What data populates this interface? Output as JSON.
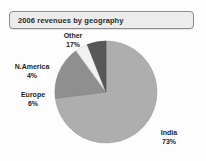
{
  "chart_data": {
    "type": "pie",
    "title": "2006 revenues by geography",
    "xlabel": "",
    "ylabel": "",
    "legend_position": "none",
    "grid": false,
    "categories": [
      "India",
      "Other",
      "N.America",
      "Europe"
    ],
    "values": [
      73,
      17,
      4,
      6
    ],
    "value_unit": "%",
    "start_angle_deg": 0,
    "direction": "clockwise",
    "slices": [
      {
        "name": "India",
        "label": "India",
        "value": 73,
        "value_label": "73%",
        "color": "#aeaeae",
        "start_deg": 0,
        "end_deg": 262.8
      },
      {
        "name": "Other",
        "label": "Other",
        "value": 17,
        "value_label": "17%",
        "color": "#8f8f8f",
        "start_deg": 262.8,
        "end_deg": 324.0
      },
      {
        "name": "N.America",
        "label": "N.America",
        "value": 4,
        "value_label": "4%",
        "color": "#f2f2f2",
        "start_deg": 324.0,
        "end_deg": 338.4
      },
      {
        "name": "Europe",
        "label": "Europe",
        "value": 6,
        "value_label": "6%",
        "color": "#585858",
        "start_deg": 338.4,
        "end_deg": 360.0
      }
    ]
  },
  "title_box": {
    "text": "2006 revenues by geography",
    "background": "#ececec",
    "border_color": "#8c8c8c"
  },
  "labels": {
    "other": {
      "name": "Other",
      "percent": "17%"
    },
    "namerica": {
      "name": "N.America",
      "percent": "4%"
    },
    "europe": {
      "name": "Europe",
      "percent": "6%"
    },
    "india": {
      "name": "India",
      "percent": "73%"
    }
  },
  "colors": {
    "background": "#fdfdfd",
    "text": "#1d1d1d",
    "india": "#aeaeae",
    "other": "#8f8f8f",
    "namerica": "#f2f2f2",
    "europe": "#585858",
    "slice_outline": "#6f6f6f"
  }
}
